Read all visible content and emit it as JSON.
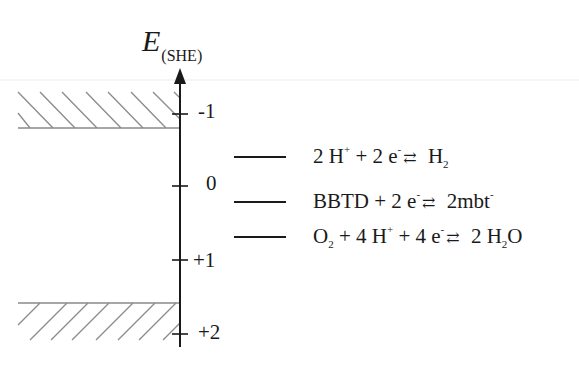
{
  "axis": {
    "title_main": "E",
    "title_sub": "(SHE)",
    "ticks": [
      {
        "label": "-1",
        "value": -1
      },
      {
        "label": "0",
        "value": 0
      },
      {
        "label": "+1",
        "value": 1
      },
      {
        "label": "+2",
        "value": 2
      }
    ]
  },
  "bands": {
    "top": {
      "description": "hatched band (conduction band edge)",
      "hatch": "down-right"
    },
    "bottom": {
      "description": "hatched band (valence band edge)",
      "hatch": "up-right"
    }
  },
  "levels": [
    {
      "parts": [
        "2 H",
        "+",
        " + 2 e",
        "-",
        "",
        " H",
        "2",
        ""
      ],
      "text": "2 H+ + 2 e- ⇄ H2"
    },
    {
      "parts": [
        "BBTD + 2 e",
        "-",
        "",
        " 2mbt",
        "-"
      ],
      "text": "BBTD + 2 e- ⇄ 2mbt-"
    },
    {
      "parts": [
        "O",
        "2",
        " + 4 H",
        "+",
        " + 4 e",
        "-",
        "",
        " 2 H",
        "2",
        "O"
      ],
      "text": "O2 + 4 H+ + 4 e- ⇄ 2 H2O"
    }
  ],
  "arrow_glyph": "⇄",
  "colors": {
    "line": "#1a1a1a",
    "hatch": "#8a8a8a",
    "faint_rule": "#e6e6e6"
  }
}
